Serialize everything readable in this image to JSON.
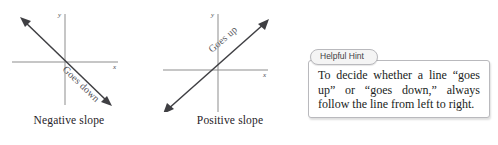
{
  "graphs": [
    {
      "id": "negative",
      "caption": "Negative slope",
      "x_axis_label": "x",
      "y_axis_label": "y",
      "line_annotation": "Goes down",
      "direction": "descending",
      "line_color": "#3f3f43",
      "axis_color": "#8d8d8d"
    },
    {
      "id": "positive",
      "caption": "Positive slope",
      "x_axis_label": "x",
      "y_axis_label": "y",
      "line_annotation": "Goes up",
      "direction": "ascending",
      "line_color": "#3f3f43",
      "axis_color": "#8d8d8d"
    }
  ],
  "hint": {
    "tab_label": "Helpful Hint",
    "body_text": "To decide whether a line “goes up” or “goes down,” always follow the line from left to right.",
    "border_color": "#b9b9bd",
    "tab_background": "#f4f4f4",
    "body_background": "#ffffff"
  }
}
